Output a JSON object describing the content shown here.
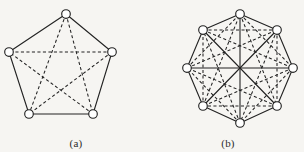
{
  "figure": {
    "background_color": "#f6f5f2",
    "ink_color": "#222222",
    "node_fill_color": "#ffffff",
    "panels": [
      {
        "id": "a",
        "caption": "(a)",
        "graph_name": "K5",
        "vertex_count": 5,
        "edge_count": 10,
        "shape": "pentagon",
        "node_radius": 4.3,
        "vertices": [
          {
            "index": 0,
            "x": 66,
            "y": 14
          },
          {
            "index": 1,
            "x": 112,
            "y": 52
          },
          {
            "index": 2,
            "x": 93,
            "y": 114
          },
          {
            "index": 3,
            "x": 29,
            "y": 114
          },
          {
            "index": 4,
            "x": 9,
            "y": 52
          }
        ],
        "solid_edges": [
          [
            0,
            1
          ],
          [
            1,
            2
          ],
          [
            2,
            3
          ],
          [
            3,
            4
          ],
          [
            4,
            0
          ]
        ],
        "dashed_edges": [
          [
            0,
            2
          ],
          [
            0,
            3
          ],
          [
            1,
            3
          ],
          [
            1,
            4
          ],
          [
            2,
            4
          ]
        ]
      },
      {
        "id": "b",
        "caption": "(b)",
        "graph_name": "K8",
        "vertex_count": 8,
        "edge_count": 28,
        "shape": "octagon",
        "node_radius": 4.3,
        "vertices": [
          {
            "index": 0,
            "x": 240,
            "y": 14
          },
          {
            "index": 1,
            "x": 277,
            "y": 30
          },
          {
            "index": 2,
            "x": 293,
            "y": 68
          },
          {
            "index": 3,
            "x": 277,
            "y": 106
          },
          {
            "index": 4,
            "x": 240,
            "y": 123
          },
          {
            "index": 5,
            "x": 203,
            "y": 106
          },
          {
            "index": 6,
            "x": 187,
            "y": 68
          },
          {
            "index": 7,
            "x": 203,
            "y": 30
          }
        ],
        "solid_edges": [
          [
            0,
            1
          ],
          [
            1,
            2
          ],
          [
            2,
            3
          ],
          [
            3,
            4
          ],
          [
            4,
            5
          ],
          [
            5,
            6
          ],
          [
            6,
            7
          ],
          [
            7,
            0
          ],
          [
            0,
            4
          ],
          [
            1,
            5
          ],
          [
            2,
            6
          ],
          [
            3,
            7
          ]
        ],
        "dashed_edges": [
          [
            0,
            2
          ],
          [
            1,
            3
          ],
          [
            2,
            4
          ],
          [
            3,
            5
          ],
          [
            4,
            6
          ],
          [
            5,
            7
          ],
          [
            6,
            0
          ],
          [
            7,
            1
          ],
          [
            0,
            3
          ],
          [
            1,
            4
          ],
          [
            2,
            5
          ],
          [
            3,
            6
          ],
          [
            4,
            7
          ],
          [
            5,
            0
          ],
          [
            6,
            1
          ],
          [
            7,
            2
          ]
        ]
      }
    ]
  },
  "chart_data": {
    "type": "diagram",
    "subtype": "graph-drawing",
    "title": "",
    "panels": [
      {
        "label": "(a)",
        "graph": "K5",
        "nodes": 5,
        "edges": 10,
        "polygon_edges_solid": 5,
        "diagonal_edges_dashed": 5
      },
      {
        "label": "(b)",
        "graph": "K8",
        "nodes": 8,
        "edges": 28,
        "polygon_edges_solid": 8,
        "long_diagonals_solid": 4,
        "other_diagonals_dashed": 16
      }
    ]
  }
}
